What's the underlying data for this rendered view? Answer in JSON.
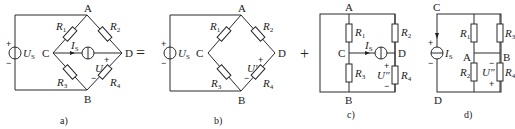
{
  "figure": {
    "operators": [
      "=",
      "+"
    ],
    "panels": [
      {
        "caption": "a)",
        "nodes": {
          "A": "A",
          "B": "B",
          "C": "C",
          "D": "D"
        },
        "voltage_source": {
          "symbol": "U",
          "sub": "S",
          "plus": "+",
          "minus": "−"
        },
        "current_source": {
          "symbol": "I",
          "sub": "S"
        },
        "resistors": [
          {
            "symbol": "R",
            "sub": "1"
          },
          {
            "symbol": "R",
            "sub": "2"
          },
          {
            "symbol": "R",
            "sub": "3"
          },
          {
            "symbol": "R",
            "sub": "4"
          }
        ],
        "measured_voltage": {
          "symbol": "U",
          "plus": "+",
          "minus": "−"
        }
      },
      {
        "caption": "b)",
        "nodes": {
          "A": "A",
          "B": "B",
          "C": "C",
          "D": "D"
        },
        "voltage_source": {
          "symbol": "U",
          "sub": "S",
          "plus": "+",
          "minus": "−"
        },
        "resistors": [
          {
            "symbol": "R",
            "sub": "1"
          },
          {
            "symbol": "R",
            "sub": "2"
          },
          {
            "symbol": "R",
            "sub": "3"
          },
          {
            "symbol": "R",
            "sub": "4"
          }
        ],
        "measured_voltage": {
          "symbol": "U′",
          "plus": "+",
          "minus": "−"
        }
      },
      {
        "caption": "c)",
        "nodes": {
          "A": "A",
          "B": "B",
          "C": "C",
          "D": "D"
        },
        "current_source": {
          "symbol": "I",
          "sub": "S"
        },
        "resistors": [
          {
            "symbol": "R",
            "sub": "1"
          },
          {
            "symbol": "R",
            "sub": "2"
          },
          {
            "symbol": "R",
            "sub": "3"
          },
          {
            "symbol": "R",
            "sub": "4"
          }
        ],
        "measured_voltage": {
          "symbol": "U″",
          "plus": "+",
          "minus": "−"
        }
      },
      {
        "caption": "d)",
        "nodes": {
          "A": "A",
          "B": "B",
          "C": "C",
          "D": "D"
        },
        "current_source": {
          "symbol": "I",
          "sub": "S",
          "plus": "+",
          "minus": "−"
        },
        "resistors": [
          {
            "symbol": "R",
            "sub": "1"
          },
          {
            "symbol": "R",
            "sub": "2"
          },
          {
            "symbol": "R",
            "sub": "3"
          },
          {
            "symbol": "R",
            "sub": "4"
          }
        ],
        "measured_voltage": {
          "symbol": "U″",
          "plus": "+",
          "minus": "−"
        }
      }
    ]
  }
}
